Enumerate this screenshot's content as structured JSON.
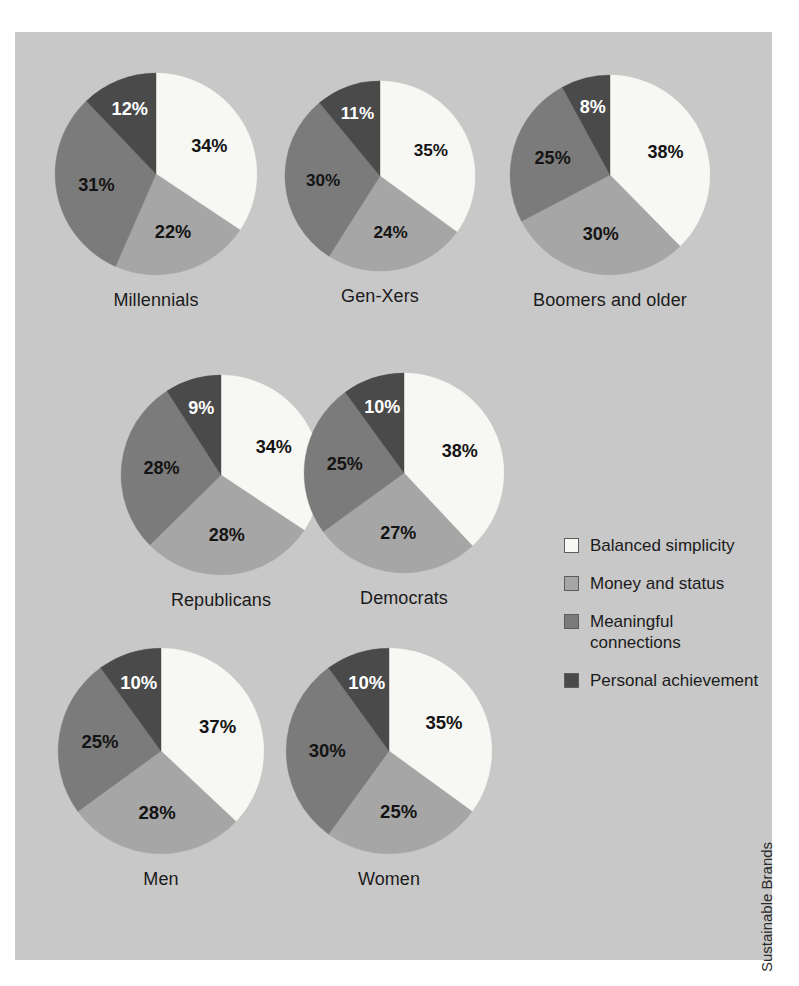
{
  "credit": "Sustainable Brands",
  "colors": {
    "panel_background": "#c8c8c8",
    "page_background": "#ffffff",
    "balanced_simplicity": "#f7f7f3",
    "money_and_status": "#a6a6a6",
    "meaningful_connections": "#7b7b7b",
    "personal_achievement": "#4a4a4a",
    "label_text": "#1b1b1b"
  },
  "legend": {
    "items": [
      {
        "label": "Balanced simplicity",
        "color": "#f7f7f3"
      },
      {
        "label": "Money and status",
        "color": "#a6a6a6"
      },
      {
        "label": "Meaningful connections",
        "color": "#7b7b7b"
      },
      {
        "label": "Personal achievement",
        "color": "#4a4a4a"
      }
    ]
  },
  "chart_data": {
    "type": "pie",
    "title": "",
    "legend_position": "right",
    "categories": [
      "Balanced simplicity",
      "Money and status",
      "Meaningful connections",
      "Personal achievement"
    ],
    "category_colors": [
      "#f7f7f3",
      "#a6a6a6",
      "#7b7b7b",
      "#4a4a4a"
    ],
    "units": "percent",
    "charts": [
      {
        "label": "Millennials",
        "row": 1,
        "values": [
          34,
          22,
          31,
          12
        ],
        "value_labels": [
          "34%",
          "22%",
          "31%",
          "12%"
        ]
      },
      {
        "label": "Gen-Xers",
        "row": 1,
        "values": [
          35,
          24,
          30,
          11
        ],
        "value_labels": [
          "35%",
          "24%",
          "30%",
          "11%"
        ]
      },
      {
        "label": "Boomers and older",
        "row": 1,
        "values": [
          38,
          30,
          25,
          8
        ],
        "value_labels": [
          "38%",
          "30%",
          "25%",
          "8%"
        ]
      },
      {
        "label": "Republicans",
        "row": 2,
        "values": [
          34,
          28,
          28,
          9
        ],
        "value_labels": [
          "34%",
          "28%",
          "28%",
          "9%"
        ]
      },
      {
        "label": "Democrats",
        "row": 2,
        "values": [
          38,
          27,
          25,
          10
        ],
        "value_labels": [
          "38%",
          "27%",
          "25%",
          "10%"
        ]
      },
      {
        "label": "Men",
        "row": 3,
        "values": [
          37,
          28,
          25,
          10
        ],
        "value_labels": [
          "37%",
          "28%",
          "25%",
          "10%"
        ]
      },
      {
        "label": "Women",
        "row": 3,
        "values": [
          35,
          25,
          30,
          10
        ],
        "value_labels": [
          "35%",
          "25%",
          "30%",
          "10%"
        ]
      }
    ]
  }
}
